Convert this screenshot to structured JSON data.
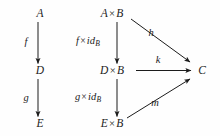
{
  "diagram": {
    "type": "commutative-diagram",
    "background_color": "#fefefe",
    "ink_color": "#1c1c1c",
    "nodes": [
      {
        "id": "A",
        "text": "A",
        "x": 40,
        "y": 14
      },
      {
        "id": "D",
        "text": "D",
        "x": 40,
        "y": 71
      },
      {
        "id": "E",
        "text": "E",
        "x": 40,
        "y": 124
      },
      {
        "id": "AxB",
        "text": "A × B",
        "x": 112,
        "y": 14
      },
      {
        "id": "DxB",
        "text": "D × B",
        "x": 112,
        "y": 71
      },
      {
        "id": "ExB",
        "text": "E × B",
        "x": 112,
        "y": 124
      },
      {
        "id": "C",
        "text": "C",
        "x": 202,
        "y": 71
      }
    ],
    "node_labels": {
      "A": "A",
      "D": "D",
      "E": "E",
      "AxB_left": "A",
      "AxB_right": "B",
      "DxB_left": "D",
      "DxB_right": "B",
      "ExB_left": "E",
      "ExB_right": "B",
      "C": "C",
      "times_symbol": "×"
    },
    "edges": [
      {
        "id": "f",
        "from": "A",
        "to": "D",
        "label": "f",
        "style": "vertical"
      },
      {
        "id": "g",
        "from": "D",
        "to": "E",
        "label": "g",
        "style": "vertical"
      },
      {
        "id": "f_x_idB",
        "from": "AxB",
        "to": "DxB",
        "label": "f × id_B",
        "style": "vertical"
      },
      {
        "id": "g_x_idB",
        "from": "DxB",
        "to": "ExB",
        "label": "g × id_B",
        "style": "vertical"
      },
      {
        "id": "h",
        "from": "AxB",
        "to": "C",
        "label": "h",
        "style": "diagonal-down"
      },
      {
        "id": "k",
        "from": "DxB",
        "to": "C",
        "label": "k",
        "style": "horizontal"
      },
      {
        "id": "m",
        "from": "ExB",
        "to": "C",
        "label": "m",
        "style": "diagonal-up"
      }
    ],
    "edge_labels": {
      "f": "f",
      "g": "g",
      "h": "h",
      "k": "k",
      "m": "m",
      "id": "id",
      "sub_B": "B",
      "times_symbol": "×"
    },
    "edge_label_positions": {
      "f": {
        "x": 26,
        "y": 42
      },
      "g": {
        "x": 26,
        "y": 98
      },
      "f_x_idB": {
        "x": 88,
        "y": 42
      },
      "g_x_idB": {
        "x": 88,
        "y": 98
      },
      "h": {
        "x": 151,
        "y": 33
      },
      "k": {
        "x": 158,
        "y": 60
      },
      "m": {
        "x": 155,
        "y": 103
      }
    }
  }
}
